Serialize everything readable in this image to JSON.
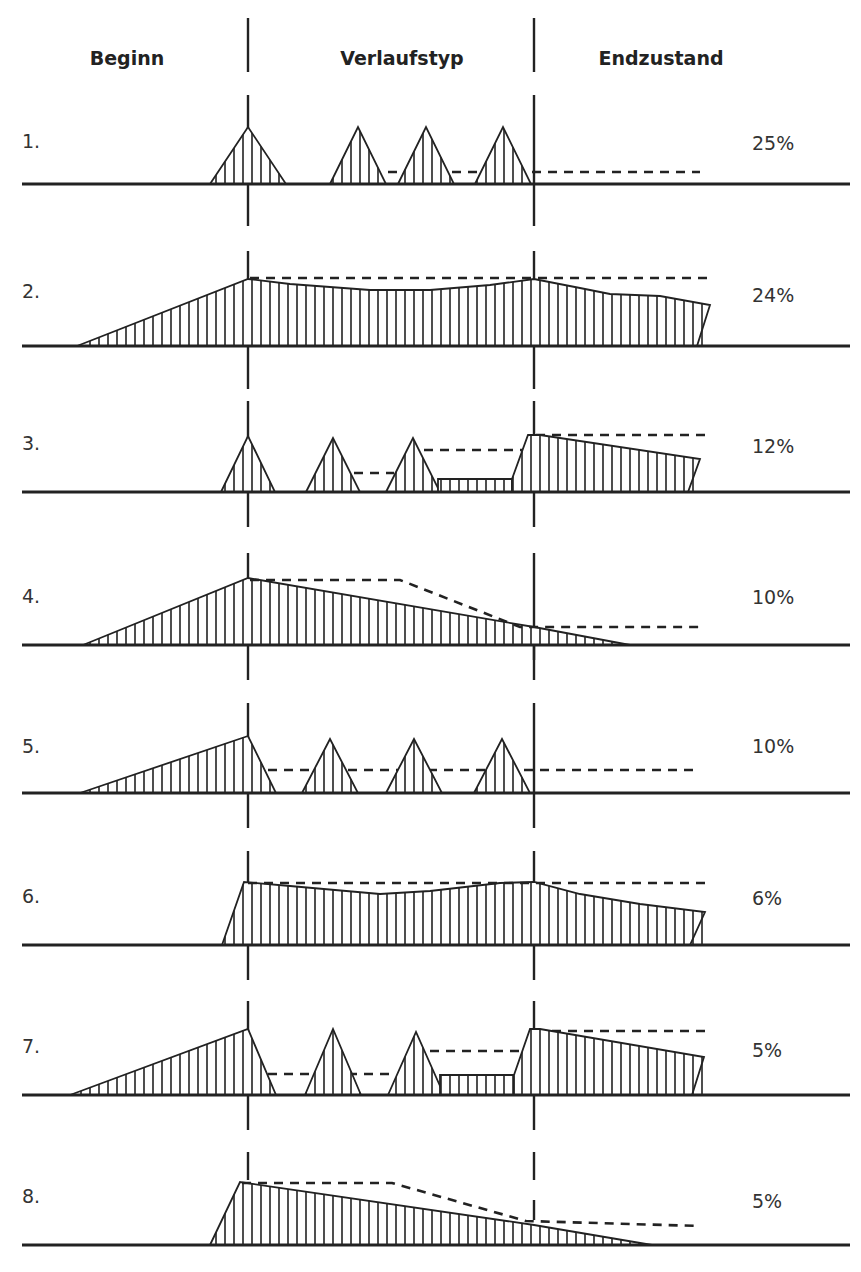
{
  "headers": {
    "beginn": "Beginn",
    "verlaufstyp": "Verlaufstyp",
    "endzustand": "Endzustand"
  },
  "rows": [
    {
      "label": "1.",
      "percent": "25%",
      "pattern": "repeated short episodes with full remission, no residual"
    },
    {
      "label": "2.",
      "percent": "24%",
      "pattern": "gradual onset, persistent course, slight decline at end"
    },
    {
      "label": "3.",
      "percent": "12%",
      "pattern": "acute episodes with increasing residual, persistent end state"
    },
    {
      "label": "4.",
      "percent": "10%",
      "pattern": "gradual onset, slow decline to remission"
    },
    {
      "label": "5.",
      "percent": "10%",
      "pattern": "gradual onset followed by repeated episodes, stable residual"
    },
    {
      "label": "6.",
      "percent": "6%",
      "pattern": "acute onset, persistent course, slight decline at end"
    },
    {
      "label": "7.",
      "percent": "5%",
      "pattern": "gradual onset, episodes with increasing residual, persistent end state"
    },
    {
      "label": "8.",
      "percent": "5%",
      "pattern": "acute onset, slow decline to remission"
    }
  ]
}
